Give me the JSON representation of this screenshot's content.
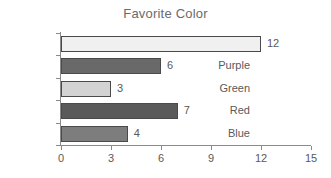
{
  "chart_data": {
    "type": "bar",
    "orientation": "horizontal",
    "title": "Favorite Color",
    "xlabel": "",
    "ylabel": "",
    "categories": [
      "Cyan",
      "Purple",
      "Green",
      "Red",
      "Blue"
    ],
    "values": [
      12,
      6,
      3,
      7,
      4
    ],
    "value_labels": [
      "12",
      "6",
      "3",
      "7",
      "4"
    ],
    "bar_colors": [
      "#f0f0f0",
      "#696969",
      "#d3d3d3",
      "#5a5a5a",
      "#7d7d7d"
    ],
    "bar_border_color": "#4a4a4a",
    "xlim": [
      0,
      15
    ],
    "x_ticks": [
      0,
      3,
      6,
      9,
      12,
      15
    ],
    "x_tick_labels": [
      "0",
      "3",
      "6",
      "9",
      "12",
      "15"
    ],
    "grid": false,
    "legend": false,
    "title_color": "#6b6b6b",
    "text_color": "#595959",
    "axis_color": "#8a8a8a",
    "background_color": "#ffffff"
  }
}
